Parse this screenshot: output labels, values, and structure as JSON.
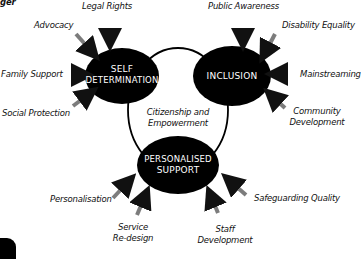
{
  "diagram": {
    "top_left_fragment": "ger",
    "center_label_line1": "Citizenship and",
    "center_label_line2": "Empowerment",
    "nodes": {
      "self_determination": {
        "line1": "SELF",
        "line2": "DETERMINATION"
      },
      "inclusion": {
        "line1": "INCLUSION"
      },
      "personalised_support": {
        "line1": "PERSONALISED",
        "line2": "SUPPORT"
      }
    },
    "inputs": {
      "self_determination": [
        "Legal Rights",
        "Advocacy",
        "Family Support",
        "Social Protection"
      ],
      "inclusion": [
        "Public Awareness",
        "Disability Equality",
        "Mainstreaming",
        "Community",
        "Development"
      ],
      "personalised_support": [
        "Personalisation",
        "Service",
        "Re-design",
        "Staff",
        "Development",
        "Safeguarding Quality"
      ]
    },
    "colors": {
      "node_fill": "#000000",
      "node_text": "#ffffff",
      "line": "#000000",
      "background": "#ffffff"
    }
  }
}
